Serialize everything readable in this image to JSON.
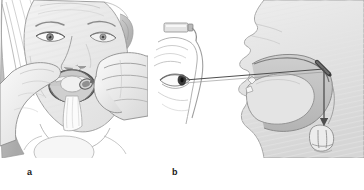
{
  "figure": {
    "background_color": "#ffffff",
    "width": 364,
    "height": 190
  },
  "panels": [
    {
      "id": "a",
      "label": "a",
      "caption": "Clinician holding the patient's tongue with gauze and inserting a warmed laryngeal mirror into the open mouth",
      "icon_name": "patient-mouth-mirror-illustration",
      "elements": [
        "patient-face",
        "hair",
        "open-mouth",
        "tongue-held-with-gauze",
        "gauze-square",
        "examiner-left-hand",
        "examiner-right-hand",
        "laryngeal-mirror",
        "mirror-handle"
      ]
    },
    {
      "id": "b",
      "label": "b",
      "caption": "Sagittal diagram: light from the head lamp travels along the examiner's line of sight to the mirror at the soft palate and is reflected down onto the larynx",
      "icon_name": "sagittal-light-path-diagram",
      "elements": [
        "head-lamp",
        "examiner-eye",
        "examiner-head-profile",
        "patient-head-sagittal-section",
        "nasal-cavity",
        "hard-palate",
        "soft-palate",
        "tongue",
        "oropharynx",
        "laryngeal-mirror-in-pharynx",
        "larynx-vocal-cords",
        "line-of-sight",
        "reflected-beam-arrow"
      ]
    }
  ],
  "colors": {
    "ink": "#595959",
    "ink_dark": "#3d3d3d",
    "ink_light": "#9b9b9b",
    "fill_light": "#f0f0f0",
    "fill_mid": "#dcdcdc",
    "fill_shade": "#c6c6c6",
    "fill_deep": "#a8a8a8",
    "mirror_dark": "#4a4a4a",
    "arrow": "#4f4f4f",
    "label_text": "#1a1a1a"
  }
}
